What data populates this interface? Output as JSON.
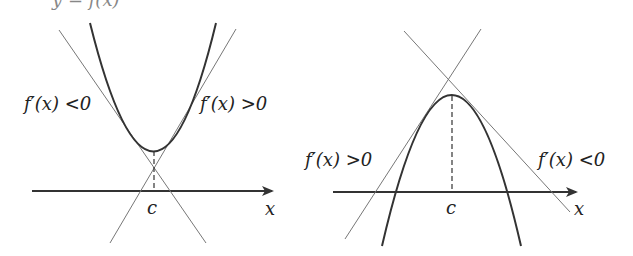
{
  "header_fragment": "y = f(x)",
  "figures": [
    {
      "id": "left",
      "title": "Local minimum",
      "curve": "convex parabola",
      "labels": {
        "left_slope": "f′(x) <0",
        "right_slope": "f′(x) >0",
        "critical_point": "c",
        "axis": "x"
      }
    },
    {
      "id": "right",
      "title": "Local maximum",
      "curve": "concave parabola",
      "labels": {
        "left_slope": "f′(x) >0",
        "right_slope": "f′(x) <0",
        "critical_point": "c",
        "axis": "x"
      }
    }
  ],
  "colors": {
    "curve": "#333333",
    "tangent": "#777777",
    "axis": "#333333",
    "text": "#222222"
  }
}
